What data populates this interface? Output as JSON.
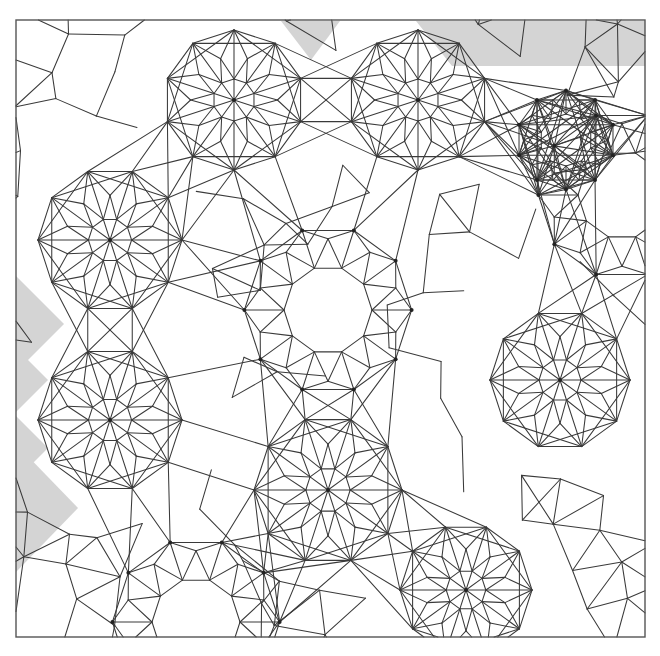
{
  "figure": {
    "kind": "geometric-tiling-diagram",
    "width": 660,
    "height": 656,
    "background_color": "#ffffff"
  },
  "frame": {
    "name": "plot-border",
    "x": 16,
    "y": 20,
    "width": 629,
    "height": 617,
    "stroke_color": "#555555",
    "stroke_width": 1.4
  },
  "style": {
    "line_color": "#3a3a3a",
    "line_width": 1.05,
    "shade_color": "#d4d4d4",
    "vertex_color": "#222222",
    "vertex_radius": 2.0
  },
  "geometry": {
    "symmetry_order": 10,
    "rosette_radius": 68,
    "decagon_radius": 41,
    "description": "Ten-fold rosette star motifs and regular decagons connected by rhombi, kites, pentagons and barrel hexagons in a Penrose/girih style quasi-periodic arrangement."
  },
  "rosettes": [
    {
      "name": "rosette-top-left-a",
      "cx": 110,
      "cy": 240,
      "r": 72,
      "phase": 0
    },
    {
      "name": "rosette-top-mid",
      "cx": 234,
      "cy": 100,
      "r": 70,
      "phase": 18
    },
    {
      "name": "rosette-top-right",
      "cx": 418,
      "cy": 100,
      "r": 70,
      "phase": 18
    },
    {
      "name": "rosette-left-low",
      "cx": 110,
      "cy": 420,
      "r": 72,
      "phase": 0
    },
    {
      "name": "rosette-center-low",
      "cx": 328,
      "cy": 490,
      "r": 74,
      "phase": 0
    },
    {
      "name": "rosette-right-mid",
      "cx": 560,
      "cy": 380,
      "r": 70,
      "phase": 0
    },
    {
      "name": "rosette-bottom-mid",
      "cx": 466,
      "cy": 590,
      "r": 66,
      "phase": 0
    }
  ],
  "decagons": [
    {
      "name": "decagon-center",
      "cx": 328,
      "cy": 310,
      "r": 44,
      "phase": 0
    },
    {
      "name": "decagon-right-edge",
      "cx": 622,
      "cy": 195,
      "r": 44,
      "phase": 0
    },
    {
      "name": "decagon-bottom-edge",
      "cx": 196,
      "cy": 622,
      "r": 44,
      "phase": 0
    },
    {
      "name": "decagon-upper-right",
      "cx": 566,
      "cy": 140,
      "r": 26,
      "phase": 18
    }
  ],
  "shaded_regions": [
    {
      "name": "shade-top-left-triangle",
      "points": "281,21 340,21 311,60",
      "color": "#d4d4d4"
    },
    {
      "name": "shade-top-right-band",
      "points": "360,21 645,21 645,66 575,66 520,66 452,66 416,21",
      "color": "#d4d4d4"
    },
    {
      "name": "shade-left-zigzag-band",
      "points": "16,276 52,276 16,276 16,280 48,312 16,344 16,348 48,380 16,412 16,416 48,448 16,480 16,484 52,520 16,556 16,276",
      "color": "#d4d4d4"
    },
    {
      "name": "shade-left-upper-wedge",
      "points": "16,276 64,324 16,372",
      "color": "#d4d4d4"
    },
    {
      "name": "shade-left-lower-wedge",
      "points": "16,444 78,508 16,572",
      "color": "#d4d4d4"
    }
  ],
  "labels": {
    "caption": "",
    "axis_labels": [],
    "legend": []
  },
  "chart_data": {
    "type": "diagram",
    "elements": {
      "rosette_count": 7,
      "decagon_count": 4,
      "shaded_region_count": 5,
      "symmetry": "10-fold local rotational symmetry"
    }
  }
}
